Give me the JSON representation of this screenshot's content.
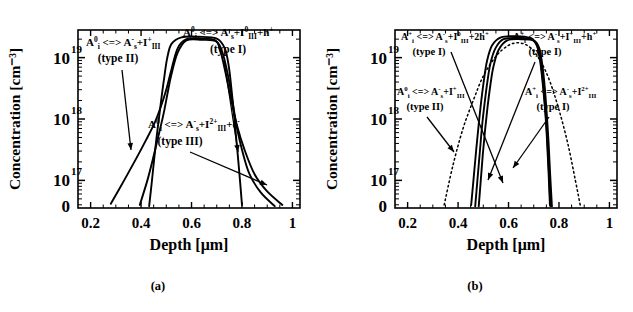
{
  "figure": {
    "panels": [
      {
        "id": "a",
        "caption": "(a)",
        "axes": {
          "xlabel": "Depth [μm]",
          "ylabel": "Concentration [cm⁻³]",
          "xticks": [
            "0.2",
            "0.4",
            "0.6",
            "0.8",
            "1"
          ],
          "xtick_values": [
            0.2,
            0.4,
            0.6,
            0.8,
            1.0
          ],
          "xlim": [
            0.15,
            1.03
          ],
          "ylabels": [
            "10",
            "10",
            "10"
          ],
          "yexponents": [
            "19",
            "18",
            "17"
          ],
          "yextra_label": "0",
          "ylim": [
            16.55,
            19.45
          ],
          "ytick_values": [
            19,
            18,
            17
          ]
        },
        "annotations": [
          {
            "name": "annotation-type-ii",
            "formula": "A⁰ᵢ <=> A⁻ₛ+I⁺ₗₗₗ",
            "parts": [
              {
                "t": "A",
                "s": "normal"
              },
              {
                "t": "0",
                "s": "sup"
              },
              {
                "t": "i",
                "s": "sub"
              },
              {
                "t": " <=> ",
                "s": "normal"
              },
              {
                "t": "A",
                "s": "normal"
              },
              {
                "t": "-",
                "s": "sup"
              },
              {
                "t": "s",
                "s": "sub"
              },
              {
                "t": "+I",
                "s": "normal"
              },
              {
                "t": "+",
                "s": "sup"
              },
              {
                "t": "III",
                "s": "sub"
              }
            ],
            "type_label": "(type II)"
          },
          {
            "name": "annotation-type-i",
            "formula": "A⁰ᵢ <=> A⁻ₛ+I⁰ₗₗₗ+h⁺",
            "parts": [
              {
                "t": "A",
                "s": "normal"
              },
              {
                "t": "0",
                "s": "sup"
              },
              {
                "t": "i",
                "s": "sub"
              },
              {
                "t": " <=> ",
                "s": "normal"
              },
              {
                "t": "A",
                "s": "normal"
              },
              {
                "t": "-",
                "s": "sup"
              },
              {
                "t": "s",
                "s": "sub"
              },
              {
                "t": "+I",
                "s": "normal"
              },
              {
                "t": "0",
                "s": "sup"
              },
              {
                "t": "III",
                "s": "sub"
              },
              {
                "t": "+h",
                "s": "normal"
              },
              {
                "t": "+",
                "s": "sup"
              }
            ],
            "type_label": "(type I)"
          },
          {
            "name": "annotation-type-iii",
            "formula": "A⁰ᵢ <=> A⁻ₛ+I²⁺ₗₗₗ+e⁻",
            "parts": [
              {
                "t": "A",
                "s": "normal"
              },
              {
                "t": "0",
                "s": "sup"
              },
              {
                "t": "i",
                "s": "sub"
              },
              {
                "t": " <=> ",
                "s": "normal"
              },
              {
                "t": "A",
                "s": "normal"
              },
              {
                "t": "-",
                "s": "sup"
              },
              {
                "t": "s",
                "s": "sub"
              },
              {
                "t": "+I",
                "s": "normal"
              },
              {
                "t": "2+",
                "s": "sup"
              },
              {
                "t": "III",
                "s": "sub"
              },
              {
                "t": "+e",
                "s": "normal"
              },
              {
                "t": "-",
                "s": "sup"
              }
            ],
            "type_label": "(type III)"
          }
        ]
      },
      {
        "id": "b",
        "caption": "(b)",
        "axes": {
          "xlabel": "Depth [μm]",
          "ylabel": "Concentration [cm⁻³]",
          "xticks": [
            "0.2",
            "0.4",
            "0.6",
            "0.8",
            "1"
          ],
          "xtick_values": [
            0.2,
            0.4,
            0.6,
            0.8,
            1.0
          ],
          "xlim": [
            0.15,
            1.03
          ],
          "ylabels": [
            "10",
            "10",
            "10"
          ],
          "yexponents": [
            "19",
            "18",
            "17"
          ],
          "yextra_label": "0",
          "ylim": [
            16.55,
            19.45
          ],
          "ytick_values": [
            19,
            18,
            17
          ]
        },
        "annotations": [
          {
            "name": "annotation-type-i-2h",
            "formula": "A⁺ᵢ <=> A⁻ₛ+I⁰ₗₗₗ+2h⁺",
            "parts": [
              {
                "t": "A",
                "s": "normal"
              },
              {
                "t": "+",
                "s": "sup"
              },
              {
                "t": "i",
                "s": "sub"
              },
              {
                "t": " <=> ",
                "s": "normal"
              },
              {
                "t": "A",
                "s": "normal"
              },
              {
                "t": "-",
                "s": "sup"
              },
              {
                "t": "s",
                "s": "sub"
              },
              {
                "t": "+I",
                "s": "normal"
              },
              {
                "t": "0",
                "s": "sup"
              },
              {
                "t": "III",
                "s": "sub"
              },
              {
                "t": "+2h",
                "s": "normal"
              },
              {
                "t": "+",
                "s": "sup"
              }
            ],
            "type_label": "(type I)"
          },
          {
            "name": "annotation-type-i-h",
            "formula": "A⁺ᵢ <=> A⁻ₛ+I⁺ₗₗₗ+h⁺",
            "parts": [
              {
                "t": "A",
                "s": "normal"
              },
              {
                "t": "+",
                "s": "sup"
              },
              {
                "t": "i",
                "s": "sub"
              },
              {
                "t": " <=> ",
                "s": "normal"
              },
              {
                "t": "A",
                "s": "normal"
              },
              {
                "t": "-",
                "s": "sup"
              },
              {
                "t": "s",
                "s": "sub"
              },
              {
                "t": "+I",
                "s": "normal"
              },
              {
                "t": "+",
                "s": "sup"
              },
              {
                "t": "III",
                "s": "sub"
              },
              {
                "t": "+h",
                "s": "normal"
              },
              {
                "t": "+",
                "s": "sup"
              }
            ],
            "type_label": "(type I)"
          },
          {
            "name": "annotation-type-ii",
            "formula": "A⁰ᵢ <=> A⁻ₛ+I⁺ₗₗₗ",
            "parts": [
              {
                "t": "A",
                "s": "normal"
              },
              {
                "t": "0",
                "s": "sup"
              },
              {
                "t": "i",
                "s": "sub"
              },
              {
                "t": " <=> ",
                "s": "normal"
              },
              {
                "t": "A",
                "s": "normal"
              },
              {
                "t": "-",
                "s": "sup"
              },
              {
                "t": "s",
                "s": "sub"
              },
              {
                "t": "+I",
                "s": "normal"
              },
              {
                "t": "+",
                "s": "sup"
              },
              {
                "t": "III",
                "s": "sub"
              }
            ],
            "type_label": "(type II)"
          },
          {
            "name": "annotation-type-i-2plus",
            "formula": "A⁺ᵢ <=> A⁻ₛ+I²⁺ₗₗₗ",
            "parts": [
              {
                "t": "A",
                "s": "normal"
              },
              {
                "t": "+",
                "s": "sup"
              },
              {
                "t": "i",
                "s": "sub"
              },
              {
                "t": " <=> ",
                "s": "normal"
              },
              {
                "t": "A",
                "s": "normal"
              },
              {
                "t": "-",
                "s": "sup"
              },
              {
                "t": "s",
                "s": "sub"
              },
              {
                "t": "+I",
                "s": "normal"
              },
              {
                "t": "2+",
                "s": "sup"
              },
              {
                "t": "III",
                "s": "sub"
              }
            ],
            "type_label": "(type I)"
          }
        ]
      }
    ]
  },
  "chart_data": [
    {
      "type": "line",
      "panel": "a",
      "title": "",
      "xlabel": "Depth [μm]",
      "ylabel": "Concentration [cm⁻³]",
      "xlim": [
        0.15,
        1.03
      ],
      "ylim": [
        16.55,
        19.45
      ],
      "ytick_labels": [
        "10¹⁹",
        "10¹⁸",
        "10¹⁷"
      ],
      "xtick_labels": [
        "0.2",
        "0.4",
        "0.6",
        "0.8",
        "1"
      ],
      "grid": false,
      "legend": "none",
      "note": "y values are log10 of concentration in cm^-3",
      "series": [
        {
          "name": "type I",
          "style": "solid",
          "x": [
            0.28,
            0.33,
            0.38,
            0.42,
            0.455,
            0.48,
            0.5,
            0.52,
            0.545,
            0.58,
            0.64,
            0.695,
            0.715,
            0.735,
            0.755,
            0.78,
            0.81,
            0.85,
            0.9,
            0.96
          ],
          "y": [
            16.62,
            16.98,
            17.35,
            17.66,
            17.95,
            18.22,
            18.48,
            18.8,
            19.15,
            19.3,
            19.31,
            19.28,
            19.1,
            18.75,
            18.35,
            17.9,
            17.5,
            17.1,
            16.82,
            16.6
          ]
        },
        {
          "name": "type II",
          "style": "solid",
          "x": [
            0.395,
            0.425,
            0.45,
            0.472,
            0.49,
            0.505,
            0.52,
            0.545,
            0.58,
            0.64,
            0.7,
            0.725,
            0.745,
            0.762,
            0.778,
            0.8,
            0.83,
            0.875,
            0.93
          ],
          "y": [
            16.6,
            17.0,
            17.4,
            17.78,
            18.1,
            18.42,
            18.72,
            19.08,
            19.28,
            19.29,
            19.26,
            19.05,
            18.7,
            18.3,
            17.9,
            17.5,
            17.1,
            16.8,
            16.58
          ]
        },
        {
          "name": "type III",
          "style": "solid",
          "x": [
            0.432,
            0.442,
            0.452,
            0.462,
            0.472,
            0.482,
            0.492,
            0.503,
            0.52,
            0.56,
            0.63,
            0.7,
            0.732,
            0.748,
            0.758,
            0.768,
            0.778,
            0.788,
            0.8
          ],
          "y": [
            16.58,
            16.95,
            17.35,
            17.72,
            18.05,
            18.38,
            18.68,
            18.98,
            19.22,
            19.33,
            19.34,
            19.31,
            19.15,
            18.85,
            18.5,
            18.1,
            17.65,
            17.2,
            16.6
          ]
        }
      ]
    },
    {
      "type": "line",
      "panel": "b",
      "title": "",
      "xlabel": "Depth [μm]",
      "ylabel": "Concentration [cm⁻³]",
      "xlim": [
        0.15,
        1.03
      ],
      "ylim": [
        16.55,
        19.45
      ],
      "ytick_labels": [
        "10¹⁹",
        "10¹⁸",
        "10¹⁷"
      ],
      "xtick_labels": [
        "0.2",
        "0.4",
        "0.6",
        "0.8",
        "1"
      ],
      "grid": false,
      "legend": "none",
      "note": "y values are log10 of concentration in cm^-3; dotted curve is the broad reference profile",
      "series": [
        {
          "name": "reference profile",
          "style": "dotted",
          "x": [
            0.345,
            0.38,
            0.42,
            0.46,
            0.5,
            0.55,
            0.6,
            0.645,
            0.69,
            0.73,
            0.765,
            0.8,
            0.835,
            0.865,
            0.885
          ],
          "y": [
            16.6,
            17.25,
            17.85,
            18.3,
            18.7,
            19.02,
            19.2,
            19.24,
            19.15,
            18.92,
            18.6,
            18.15,
            17.6,
            17.0,
            16.58
          ]
        },
        {
          "name": "type I (2h+)",
          "style": "solid",
          "x": [
            0.452,
            0.462,
            0.472,
            0.482,
            0.492,
            0.503,
            0.515,
            0.535,
            0.57,
            0.63,
            0.685,
            0.712,
            0.725,
            0.735,
            0.745,
            0.752,
            0.758,
            0.764
          ],
          "y": [
            16.6,
            17.05,
            17.5,
            17.92,
            18.3,
            18.65,
            18.95,
            19.2,
            19.33,
            19.35,
            19.32,
            19.2,
            18.95,
            18.6,
            18.15,
            17.7,
            17.2,
            16.6
          ]
        },
        {
          "name": "type II",
          "style": "solid",
          "x": [
            0.468,
            0.477,
            0.486,
            0.495,
            0.505,
            0.516,
            0.528,
            0.548,
            0.58,
            0.64,
            0.69,
            0.715,
            0.728,
            0.738,
            0.747,
            0.754,
            0.76,
            0.766
          ],
          "y": [
            16.58,
            17.02,
            17.45,
            17.88,
            18.25,
            18.6,
            18.9,
            19.15,
            19.3,
            19.32,
            19.3,
            19.18,
            18.92,
            18.55,
            18.1,
            17.65,
            17.15,
            16.58
          ]
        },
        {
          "name": "type I (h+)",
          "style": "solid",
          "x": [
            0.482,
            0.49,
            0.498,
            0.507,
            0.517,
            0.528,
            0.54,
            0.56,
            0.595,
            0.65,
            0.7,
            0.722,
            0.734,
            0.744,
            0.752,
            0.759,
            0.765,
            0.772
          ],
          "y": [
            16.58,
            17.0,
            17.42,
            17.82,
            18.2,
            18.55,
            18.85,
            19.12,
            19.28,
            19.3,
            19.28,
            19.15,
            18.88,
            18.5,
            18.05,
            17.6,
            17.1,
            16.58
          ]
        }
      ]
    }
  ]
}
